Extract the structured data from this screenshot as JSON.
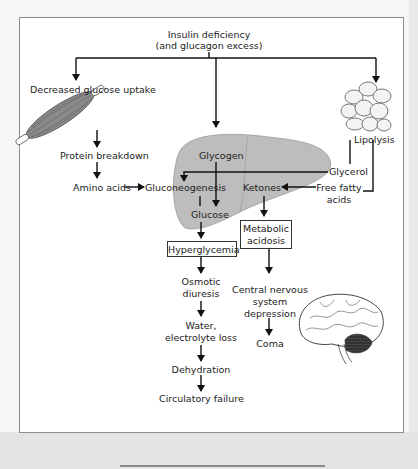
{
  "diagram": {
    "root": {
      "line1": "Insulin deficiency",
      "line2": "(and glucagon excess)"
    },
    "left_branch": {
      "uptake": "Decreased glucose uptake",
      "protein": "Protein breakdown",
      "amino": "Amino acids"
    },
    "center": {
      "glycogen": "Glycogen",
      "gluconeogenesis": "Gluconeogenesis",
      "glucose": "Glucose",
      "hyperglycemia": "Hyperglycemia",
      "osmotic_1": "Osmotic",
      "osmotic_2": "diuresis",
      "water_1": "Water,",
      "water_2": "electrolyte loss",
      "dehydration": "Dehydration",
      "circulatory": "Circulatory failure"
    },
    "right_branch": {
      "lipolysis": "Lipolysis",
      "glycerol": "Glycerol",
      "ffa_1": "Free fatty",
      "ffa_2": "acids",
      "ketones": "Ketones",
      "acidosis_1": "Metabolic",
      "acidosis_2": "acidosis",
      "cns_1": "Central nervous",
      "cns_2": "system",
      "cns_3": "depression",
      "coma": "Coma"
    },
    "colors": {
      "line": "#111111",
      "liver_fill": "#bdbdbd",
      "frame_border": "#8c8c8c",
      "background": "#f6f6f6"
    }
  }
}
